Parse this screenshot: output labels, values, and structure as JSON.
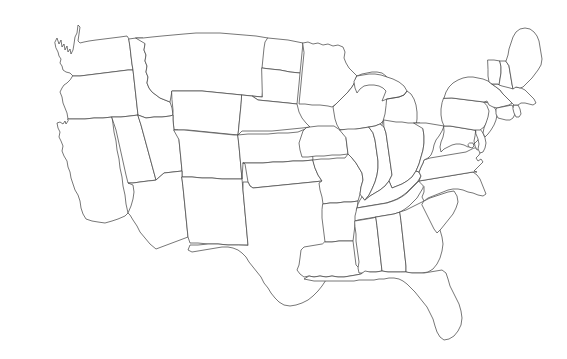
{
  "document": {
    "type": "map",
    "title": "Blank outline map of the contiguous United States",
    "subtitle": "",
    "has_labels": false,
    "has_legend": false,
    "has_title_text": false,
    "caption": ""
  },
  "canvas": {
    "width": 567,
    "height": 359,
    "background_color": "#ffffff"
  },
  "style": {
    "border_color": "#4a4a4a",
    "border_width": 0.75,
    "fill_color": "#ffffff",
    "projection": "albers-usa"
  },
  "map": {
    "region": "contiguous-united-states",
    "state_count": 49,
    "bounds": {
      "left": 28,
      "top": 20,
      "right": 545,
      "bottom": 346
    },
    "states": [
      {
        "code": "WA",
        "name": "Washington"
      },
      {
        "code": "OR",
        "name": "Oregon"
      },
      {
        "code": "CA",
        "name": "California"
      },
      {
        "code": "NV",
        "name": "Nevada"
      },
      {
        "code": "ID",
        "name": "Idaho"
      },
      {
        "code": "MT",
        "name": "Montana"
      },
      {
        "code": "WY",
        "name": "Wyoming"
      },
      {
        "code": "UT",
        "name": "Utah"
      },
      {
        "code": "AZ",
        "name": "Arizona"
      },
      {
        "code": "CO",
        "name": "Colorado"
      },
      {
        "code": "NM",
        "name": "New Mexico"
      },
      {
        "code": "ND",
        "name": "North Dakota"
      },
      {
        "code": "SD",
        "name": "South Dakota"
      },
      {
        "code": "NE",
        "name": "Nebraska"
      },
      {
        "code": "KS",
        "name": "Kansas"
      },
      {
        "code": "OK",
        "name": "Oklahoma"
      },
      {
        "code": "TX",
        "name": "Texas"
      },
      {
        "code": "MN",
        "name": "Minnesota"
      },
      {
        "code": "IA",
        "name": "Iowa"
      },
      {
        "code": "MO",
        "name": "Missouri"
      },
      {
        "code": "AR",
        "name": "Arkansas"
      },
      {
        "code": "LA",
        "name": "Louisiana"
      },
      {
        "code": "WI",
        "name": "Wisconsin"
      },
      {
        "code": "IL",
        "name": "Illinois"
      },
      {
        "code": "MI",
        "name": "Michigan"
      },
      {
        "code": "IN",
        "name": "Indiana"
      },
      {
        "code": "OH",
        "name": "Ohio"
      },
      {
        "code": "KY",
        "name": "Kentucky"
      },
      {
        "code": "TN",
        "name": "Tennessee"
      },
      {
        "code": "MS",
        "name": "Mississippi"
      },
      {
        "code": "AL",
        "name": "Alabama"
      },
      {
        "code": "GA",
        "name": "Georgia"
      },
      {
        "code": "FL",
        "name": "Florida"
      },
      {
        "code": "SC",
        "name": "South Carolina"
      },
      {
        "code": "NC",
        "name": "North Carolina"
      },
      {
        "code": "VA",
        "name": "Virginia"
      },
      {
        "code": "WV",
        "name": "West Virginia"
      },
      {
        "code": "MD",
        "name": "Maryland"
      },
      {
        "code": "DE",
        "name": "Delaware"
      },
      {
        "code": "PA",
        "name": "Pennsylvania"
      },
      {
        "code": "NJ",
        "name": "New Jersey"
      },
      {
        "code": "NY",
        "name": "New York"
      },
      {
        "code": "CT",
        "name": "Connecticut"
      },
      {
        "code": "RI",
        "name": "Rhode Island"
      },
      {
        "code": "MA",
        "name": "Massachusetts"
      },
      {
        "code": "VT",
        "name": "Vermont"
      },
      {
        "code": "NH",
        "name": "New Hampshire"
      },
      {
        "code": "ME",
        "name": "Maine"
      },
      {
        "code": "DC",
        "name": "District of Columbia"
      }
    ]
  }
}
